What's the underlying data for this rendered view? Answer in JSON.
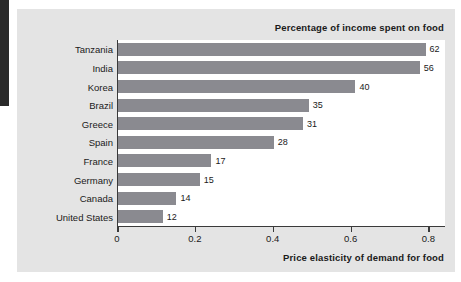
{
  "chart_data": {
    "type": "bar",
    "orientation": "horizontal",
    "title": "Percentage of income spent on food",
    "subtitle": "",
    "xlabel": "Price elasticity of demand for food",
    "ylabel": "",
    "xlim": [
      0,
      0.84
    ],
    "ylim": null,
    "grid": false,
    "legend": null,
    "xticks": [
      "0",
      "0.2",
      "0.4",
      "0.6",
      "0.8"
    ],
    "xtick_values": [
      0,
      0.2,
      0.4,
      0.6,
      0.8
    ],
    "categories": [
      "Tanzania",
      "India",
      "Korea",
      "Brazil",
      "Greece",
      "Spain",
      "France",
      "Germany",
      "Canada",
      "United States"
    ],
    "bar_lengths": [
      0.79,
      0.775,
      0.61,
      0.49,
      0.475,
      0.4,
      0.24,
      0.21,
      0.15,
      0.115
    ],
    "data_labels": [
      "62",
      "56",
      "40",
      "35",
      "31",
      "28",
      "17",
      "15",
      "14",
      "12"
    ],
    "values": [
      62,
      56,
      40,
      35,
      31,
      28,
      17,
      15,
      14,
      12
    ],
    "series": [
      {
        "name": "Percentage of income spent on food",
        "values": [
          62,
          56,
          40,
          35,
          31,
          28,
          17,
          15,
          14,
          12
        ]
      },
      {
        "name": "Price elasticity of demand for food",
        "values": [
          0.79,
          0.775,
          0.61,
          0.49,
          0.475,
          0.4,
          0.24,
          0.21,
          0.15,
          0.115
        ]
      }
    ],
    "bar_color": "#8a8a90",
    "panel_color": "#e4e4e4",
    "plot_background": "#ffffff",
    "axis_color": "#3a3a3a",
    "text_color": "#1a1a1a"
  },
  "rows": [
    {
      "category": "Tanzania",
      "label": "62",
      "length": 0.79
    },
    {
      "category": "India",
      "label": "56",
      "length": 0.775
    },
    {
      "category": "Korea",
      "label": "40",
      "length": 0.61
    },
    {
      "category": "Brazil",
      "label": "35",
      "length": 0.49
    },
    {
      "category": "Greece",
      "label": "31",
      "length": 0.475
    },
    {
      "category": "Spain",
      "label": "28",
      "length": 0.4
    },
    {
      "category": "France",
      "label": "17",
      "length": 0.24
    },
    {
      "category": "Germany",
      "label": "15",
      "length": 0.21
    },
    {
      "category": "Canada",
      "label": "14",
      "length": 0.15
    },
    {
      "category": "United States",
      "label": "12",
      "length": 0.115
    }
  ]
}
